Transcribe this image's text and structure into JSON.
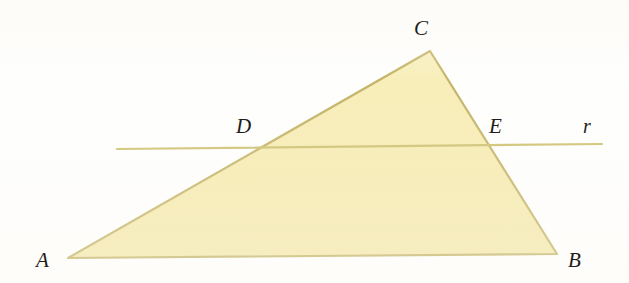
{
  "figure": {
    "kind": "geometry-diagram",
    "colors": {
      "triangle_fill": "#F6EBB1",
      "triangle_stroke": "#C4B468",
      "line_stroke": "#CFC273",
      "label_color": "#1F1D1B",
      "background": "#FEFEFD"
    },
    "triangle": {
      "name": "triangle-ABC",
      "vertices": [
        {
          "label": "A",
          "x": 68,
          "y": 258,
          "label_x": 36,
          "label_y": 250
        },
        {
          "label": "B",
          "x": 557,
          "y": 254,
          "label_x": 568,
          "label_y": 250
        },
        {
          "label": "C",
          "x": 430,
          "y": 51,
          "label_x": 414,
          "label_y": 18
        }
      ]
    },
    "transversal": {
      "label": "r",
      "label_x": 583,
      "label_y": 116,
      "x1": 117,
      "y1": 149,
      "x2": 602,
      "y2": 144
    },
    "intersections": [
      {
        "label": "D",
        "on_side": "AC",
        "x": 258,
        "y": 147,
        "label_x": 236,
        "label_y": 116
      },
      {
        "label": "E",
        "on_side": "BC",
        "x": 490,
        "y": 146,
        "label_x": 489,
        "label_y": 116
      }
    ]
  }
}
